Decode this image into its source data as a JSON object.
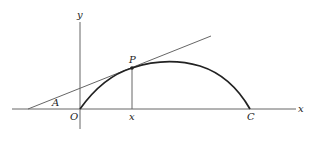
{
  "diagram": {
    "type": "geometry-figure",
    "labels": {
      "x_axis": "x",
      "y_axis": "y",
      "origin": "O",
      "point_p": "P",
      "point_c": "C",
      "angle_a": "A",
      "foot_x": "x"
    },
    "colors": {
      "axis": "#555555",
      "curve": "#222222",
      "tangent": "#555555",
      "text": "#222222"
    }
  }
}
